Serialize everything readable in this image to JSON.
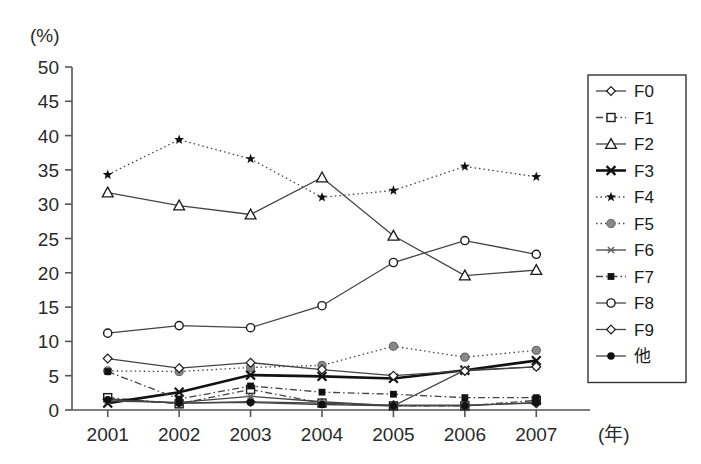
{
  "chart_data": {
    "type": "line",
    "title": "",
    "xlabel": "(年)",
    "ylabel": "(%)",
    "unit_top_left": "(%)",
    "x": [
      "2001",
      "2002",
      "2003",
      "2004",
      "2005",
      "2006",
      "2007"
    ],
    "categories": [
      "2001",
      "2002",
      "2003",
      "2004",
      "2005",
      "2006",
      "2007"
    ],
    "xtick_labels": [
      "2001",
      "2002",
      "2003",
      "2004",
      "2005",
      "2006",
      "2007"
    ],
    "ytick_labels": [
      "0",
      "5",
      "10",
      "15",
      "20",
      "25",
      "30",
      "35",
      "40",
      "45",
      "50"
    ],
    "yticks": [
      0,
      5,
      10,
      15,
      20,
      25,
      30,
      35,
      40,
      45,
      50
    ],
    "ylim": [
      0,
      50
    ],
    "grid": false,
    "legend_position": "right",
    "series": [
      {
        "name": "F0",
        "marker": "open-diamond",
        "line": "solid",
        "values": [
          1.6,
          1.0,
          1.2,
          1.0,
          0.7,
          0.7,
          1.0
        ]
      },
      {
        "name": "F1",
        "marker": "open-square",
        "line": "dash-dot",
        "values": [
          1.8,
          0.9,
          3.0,
          1.0,
          0.6,
          0.6,
          1.4
        ]
      },
      {
        "name": "F2",
        "marker": "open-triangle",
        "line": "solid",
        "values": [
          31.7,
          29.8,
          28.5,
          33.9,
          25.4,
          19.6,
          20.4
        ]
      },
      {
        "name": "F3",
        "marker": "x-cross",
        "line": "solid-bold",
        "values": [
          1.0,
          2.6,
          5.1,
          4.9,
          4.6,
          5.8,
          7.2
        ]
      },
      {
        "name": "F4",
        "marker": "filled-star",
        "line": "dotted",
        "values": [
          34.3,
          39.4,
          36.6,
          31.0,
          32.0,
          35.5,
          34.0
        ]
      },
      {
        "name": "F5",
        "marker": "filled-circle-gray",
        "line": "dotted",
        "values": [
          5.7,
          5.6,
          6.2,
          6.5,
          9.3,
          7.7,
          8.7
        ]
      },
      {
        "name": "F6",
        "marker": "asterisk",
        "line": "solid",
        "values": [
          1.3,
          1.1,
          2.0,
          1.2,
          0.6,
          5.8,
          6.3
        ]
      },
      {
        "name": "F7",
        "marker": "filled-square",
        "line": "dash-dot",
        "values": [
          5.6,
          1.6,
          3.5,
          2.6,
          2.3,
          1.8,
          1.8
        ]
      },
      {
        "name": "F8",
        "marker": "open-circle",
        "line": "solid",
        "values": [
          11.2,
          12.3,
          12.0,
          15.2,
          21.5,
          24.7,
          22.7
        ]
      },
      {
        "name": "F9",
        "marker": "open-diamond",
        "line": "solid",
        "values": [
          7.5,
          6.1,
          6.9,
          5.9,
          5.0,
          5.7,
          6.3
        ]
      },
      {
        "name": "他",
        "marker": "filled-circle",
        "line": "solid",
        "values": [
          1.5,
          1.0,
          1.1,
          0.8,
          0.6,
          0.6,
          1.1
        ]
      }
    ]
  },
  "legend": {
    "items": [
      {
        "label": "F0"
      },
      {
        "label": "F1"
      },
      {
        "label": "F2"
      },
      {
        "label": "F3"
      },
      {
        "label": "F4"
      },
      {
        "label": "F5"
      },
      {
        "label": "F6"
      },
      {
        "label": "F7"
      },
      {
        "label": "F8"
      },
      {
        "label": "F9"
      },
      {
        "label": "他"
      }
    ]
  },
  "colors": {
    "axis": "#555555",
    "text": "#2a2a2a",
    "line_default": "#444444",
    "line_bold": "#111111",
    "gray_marker": "#888888",
    "legend_border": "#333333",
    "background": "#ffffff"
  }
}
